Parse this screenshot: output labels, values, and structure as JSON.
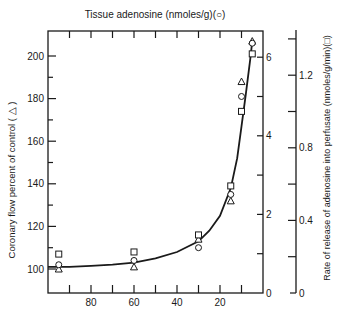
{
  "chart_data": {
    "type": "scatter",
    "title": "Tissue adenosine (nmoles/g)(○)",
    "xlabel": "",
    "ylabel": "Coronary flow percent of control (△)",
    "ylabel_right_inner": "Tissue adenosine (nmoles/g)",
    "ylabel_right_outer": "Rate of release of adenosine into perfusate (nmoles/g/min)(□)",
    "x_axis": {
      "range": [
        100,
        0
      ],
      "ticks": [
        "80",
        "60",
        "40",
        "20"
      ],
      "reversed": true
    },
    "y_left": {
      "range": [
        90,
        210
      ],
      "ticks": [
        "100",
        "120",
        "140",
        "160",
        "180",
        "200"
      ]
    },
    "y_right_inner": {
      "range": [
        0,
        6.7
      ],
      "ticks": [
        "0",
        "2",
        "4",
        "6"
      ]
    },
    "y_right_outer": {
      "range": [
        0,
        1.5
      ],
      "ticks": [
        "0",
        "0.4",
        "0.8",
        "1.2"
      ]
    },
    "grid": false,
    "series": [
      {
        "name": "Coronary flow (△)",
        "marker": "triangle",
        "x": [
          95,
          60,
          30,
          15,
          10,
          5
        ],
        "y": [
          100,
          101,
          114,
          132,
          188,
          207
        ]
      },
      {
        "name": "Tissue adenosine (○)",
        "marker": "circle",
        "x": [
          95,
          60,
          30,
          15,
          10,
          5
        ],
        "y": [
          102,
          104,
          110,
          135,
          181,
          206
        ]
      },
      {
        "name": "Adenosine release rate (□)",
        "marker": "square",
        "x": [
          95,
          60,
          30,
          15,
          10,
          5
        ],
        "y": [
          107,
          108,
          116,
          139,
          174,
          201
        ]
      }
    ],
    "fit_curve": {
      "x": [
        100,
        90,
        80,
        70,
        60,
        50,
        40,
        30,
        25,
        20,
        15,
        12,
        10,
        8,
        6,
        5
      ],
      "y": [
        101,
        101,
        101.5,
        102,
        103,
        105,
        108,
        113,
        118,
        125,
        138,
        152,
        167,
        182,
        198,
        207
      ]
    }
  },
  "labels": {
    "top_title": "Tissue adenosine (nmoles/g)(○)",
    "left_axis": "Coronary flow percent of control ( △ )",
    "right_axis": "Rate of release of adenosine into perfusate (nmoles/g/min)(□)"
  }
}
